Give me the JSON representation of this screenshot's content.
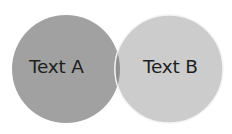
{
  "diagram": {
    "type": "venn",
    "sets": [
      {
        "label": "Text A",
        "color": "#a0a0a0"
      },
      {
        "label": "Text B",
        "color": "#cbcbcb"
      }
    ],
    "intersection_color": "#8e8e8e",
    "outline_color": "#f2f2f2"
  }
}
